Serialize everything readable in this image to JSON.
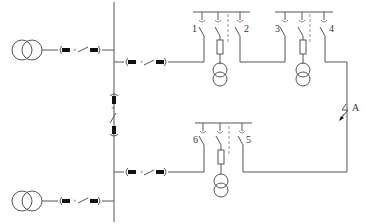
{
  "diagram": {
    "type": "electrical single-line diagram (ring main network)",
    "switch_labels": [
      "1",
      "2",
      "3",
      "4",
      "5",
      "6"
    ],
    "fault_label": "A",
    "colors": {
      "line": "#555555",
      "background": "#ffffff",
      "connector": "#111111"
    },
    "components": {
      "source_transformers": 2,
      "ring_main_units": 3,
      "distribution_transformers": 3,
      "bus_tie_breaker": 1,
      "feeder_breakers": 4
    }
  }
}
